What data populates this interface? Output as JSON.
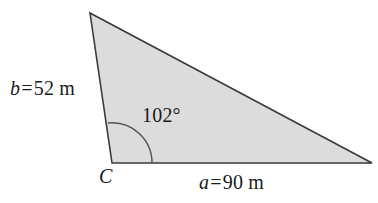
{
  "figure": {
    "type": "triangle-diagram",
    "background_color": "#ffffff",
    "fill_color": "#dcdcdc",
    "stroke_color": "#3a3a3a",
    "text_color": "#1a1a1a"
  },
  "labels": {
    "side_b": {
      "variable": "b",
      "equals": "=",
      "value": "52",
      "unit": "m",
      "full": "b = 52 m"
    },
    "side_a": {
      "variable": "a",
      "equals": "=",
      "value": "90",
      "unit": "m",
      "full": "a = 90 m"
    },
    "angle_c": {
      "value": "102",
      "degree_symbol": "°",
      "full": "102°"
    },
    "vertex_c": {
      "name": "C"
    }
  },
  "geometry": {
    "vertices": {
      "apex": {
        "x": 90,
        "y": 13
      },
      "vertex_c": {
        "x": 112,
        "y": 163
      },
      "right": {
        "x": 372,
        "y": 163
      }
    },
    "angle_arc": {
      "center_x": 112,
      "center_y": 163,
      "radius": 40,
      "start_x": 108,
      "start_y": 123,
      "end_x": 152,
      "end_y": 163
    }
  },
  "chart_data": {
    "type": "table",
    "categories": [
      "side a",
      "side b",
      "angle C"
    ],
    "values": [
      90,
      52,
      102
    ],
    "units": [
      "m",
      "m",
      "degrees"
    ],
    "xlabel": "",
    "ylabel": ""
  }
}
